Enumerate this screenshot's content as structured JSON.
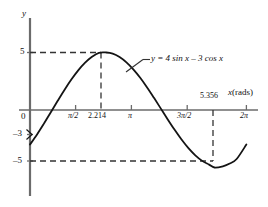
{
  "figure": {
    "axis_y_label": "y",
    "axis_x_label": "x",
    "axis_x_units": "(rads)",
    "equation_label": "y = 4 sin x – 3 cos x",
    "colors": {
      "curve": "#1a1a1a",
      "axis": "#555555",
      "dashed": "#333333",
      "background": "#ffffff"
    }
  },
  "chart_data": {
    "type": "line",
    "title": "",
    "xlabel": "x (rads)",
    "ylabel": "y",
    "equation": "y = 4 sin x - 3 cos x",
    "xlim": [
      0,
      6.2832
    ],
    "ylim": [
      -7,
      7
    ],
    "grid": false,
    "legend": "none",
    "x_ticks": [
      {
        "value": 0,
        "label": "0"
      },
      {
        "value": 1.5708,
        "label": "π/2"
      },
      {
        "value": 2.214,
        "label": "2.214"
      },
      {
        "value": 3.1416,
        "label": "π"
      },
      {
        "value": 4.7124,
        "label": "3π/2"
      },
      {
        "value": 5.356,
        "label": "5.356"
      },
      {
        "value": 6.2832,
        "label": "2π"
      }
    ],
    "y_ticks": [
      {
        "value": 5,
        "label": "5"
      },
      {
        "value": 0,
        "label": "0"
      },
      {
        "value": -3,
        "label": "–3"
      },
      {
        "value": -5,
        "label": "–5"
      }
    ],
    "annotations": [
      {
        "kind": "max",
        "x": 2.214,
        "y": 5,
        "note": "maximum value 5 at x = 2.214"
      },
      {
        "kind": "min",
        "x": 5.356,
        "y": -5,
        "note": "minimum value –5 at x = 5.356"
      },
      {
        "kind": "y-intercept",
        "x": 0,
        "y": -3,
        "note": "curve starts at y = –3"
      }
    ],
    "series": [
      {
        "name": "y = 4 sin x - 3 cos x",
        "amplitude": 5,
        "phase_shift": 0.6435,
        "points": [
          [
            0.0,
            -3.0
          ],
          [
            0.2,
            -2.147
          ],
          [
            0.4,
            -1.205
          ],
          [
            0.6,
            -0.218
          ],
          [
            0.8,
            0.778
          ],
          [
            1.0,
            1.745
          ],
          [
            1.2,
            2.644
          ],
          [
            1.4,
            3.443
          ],
          [
            1.6,
            4.113
          ],
          [
            1.8,
            4.63
          ],
          [
            2.0,
            4.976
          ],
          [
            2.214,
            5.0
          ],
          [
            2.4,
            4.906
          ],
          [
            2.6,
            4.609
          ],
          [
            2.8,
            4.146
          ],
          [
            3.0,
            3.535
          ],
          [
            3.2,
            2.797
          ],
          [
            3.4,
            1.961
          ],
          [
            3.6,
            1.057
          ],
          [
            3.8,
            0.119
          ],
          [
            4.0,
            -0.821
          ],
          [
            4.2,
            -1.727
          ],
          [
            4.4,
            -2.568
          ],
          [
            4.6,
            -3.314
          ],
          [
            4.8,
            -3.94
          ],
          [
            5.0,
            -4.424
          ],
          [
            5.2,
            -4.75
          ],
          [
            5.356,
            -5.0
          ],
          [
            5.6,
            -4.894
          ],
          [
            5.8,
            -4.655
          ],
          [
            6.0,
            -4.263
          ],
          [
            6.2832,
            -3.0
          ]
        ]
      }
    ],
    "dashed_guides": [
      {
        "orientation": "horizontal",
        "value": 5,
        "from_x": 0,
        "to_x": 2.214
      },
      {
        "orientation": "vertical",
        "value": 2.214,
        "from_y": 0,
        "to_y": 5
      },
      {
        "orientation": "horizontal",
        "value": -5,
        "from_x": 0,
        "to_x": 5.356
      },
      {
        "orientation": "vertical",
        "value": 5.356,
        "from_y": 0,
        "to_y": -5
      }
    ]
  }
}
